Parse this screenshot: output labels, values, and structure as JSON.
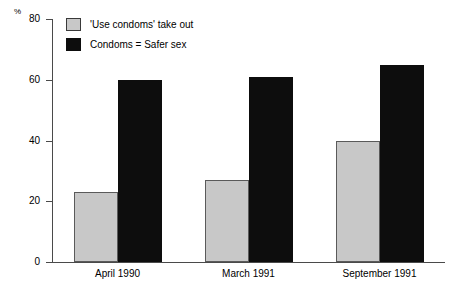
{
  "chart_data": {
    "type": "bar",
    "title": "",
    "xlabel": "",
    "ylabel": "%",
    "ylim": [
      0,
      80
    ],
    "yticks": [
      0,
      20,
      40,
      60,
      80
    ],
    "ytick_labels": [
      "0",
      "20",
      "40",
      "60",
      "80"
    ],
    "grid": false,
    "legend_position": "top-left",
    "categories": [
      "April 1990",
      "March 1991",
      "September 1991"
    ],
    "series": [
      {
        "name": "'Use condoms' take out",
        "color": "#c8c8c8",
        "values": [
          23,
          27,
          40
        ]
      },
      {
        "name": "Condoms = Safer sex",
        "color": "#0d0d0d",
        "values": [
          60,
          61,
          65
        ]
      }
    ]
  },
  "axis": {
    "unit_label": "%"
  },
  "legend": {
    "items": [
      {
        "label": "'Use condoms' take out",
        "swatch": "gray"
      },
      {
        "label": "Condoms = Safer sex",
        "swatch": "black"
      }
    ]
  }
}
